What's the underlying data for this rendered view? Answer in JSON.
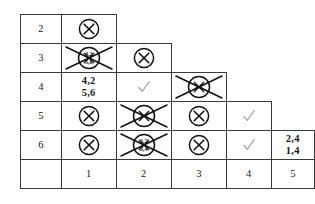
{
  "diagram": {
    "type": "triangular-staircase-table",
    "row_labels": [
      "2",
      "3",
      "4",
      "5",
      "6",
      ""
    ],
    "column_labels": [
      "1",
      "2",
      "3",
      "4",
      "5"
    ],
    "marks": {
      "circled_x": "circled-x",
      "crossed_circled_x": "crossed-out-circled-x",
      "check": "✓"
    },
    "ink_color": "#1a1a1a",
    "border_color": "#3a3a3a",
    "pencil_color": "#9a9a9a",
    "rows": [
      {
        "label": "2",
        "cells": [
          {
            "col": "1",
            "kind": "circled_x",
            "text": ""
          },
          {
            "col": "2",
            "kind": "absent",
            "text": ""
          },
          {
            "col": "3",
            "kind": "absent",
            "text": ""
          },
          {
            "col": "4",
            "kind": "absent",
            "text": ""
          },
          {
            "col": "5",
            "kind": "absent",
            "text": ""
          }
        ]
      },
      {
        "label": "3",
        "cells": [
          {
            "col": "1",
            "kind": "crossed_circled_x",
            "text": "4,2\n5,6"
          },
          {
            "col": "2",
            "kind": "circled_x",
            "text": ""
          },
          {
            "col": "3",
            "kind": "absent",
            "text": ""
          },
          {
            "col": "4",
            "kind": "absent",
            "text": ""
          },
          {
            "col": "5",
            "kind": "absent",
            "text": ""
          }
        ]
      },
      {
        "label": "4",
        "cells": [
          {
            "col": "1",
            "kind": "numbers",
            "text": "4,2\n5,6"
          },
          {
            "col": "2",
            "kind": "check",
            "text": ""
          },
          {
            "col": "3",
            "kind": "crossed_circled_x",
            "text": "1,2"
          },
          {
            "col": "4",
            "kind": "absent",
            "text": ""
          },
          {
            "col": "5",
            "kind": "absent",
            "text": ""
          }
        ]
      },
      {
        "label": "5",
        "cells": [
          {
            "col": "1",
            "kind": "circled_x",
            "text": ""
          },
          {
            "col": "2",
            "kind": "crossed_circled_x",
            "text": "1,3"
          },
          {
            "col": "3",
            "kind": "circled_x",
            "text": ""
          },
          {
            "col": "4",
            "kind": "check",
            "text": ""
          },
          {
            "col": "5",
            "kind": "absent",
            "text": ""
          }
        ]
      },
      {
        "label": "6",
        "cells": [
          {
            "col": "1",
            "kind": "circled_x",
            "text": ""
          },
          {
            "col": "2",
            "kind": "crossed_circled_x",
            "text": "3,2\n3,4"
          },
          {
            "col": "3",
            "kind": "circled_x",
            "text": ""
          },
          {
            "col": "4",
            "kind": "check",
            "text": ""
          },
          {
            "col": "5",
            "kind": "numbers",
            "text": "2,4\n1,4"
          }
        ]
      },
      {
        "label": "",
        "cells": [
          {
            "col": "1",
            "kind": "header",
            "text": "1"
          },
          {
            "col": "2",
            "kind": "header",
            "text": "2"
          },
          {
            "col": "3",
            "kind": "header",
            "text": "3"
          },
          {
            "col": "4",
            "kind": "header",
            "text": "4"
          },
          {
            "col": "5",
            "kind": "header",
            "text": "5"
          }
        ]
      }
    ]
  }
}
